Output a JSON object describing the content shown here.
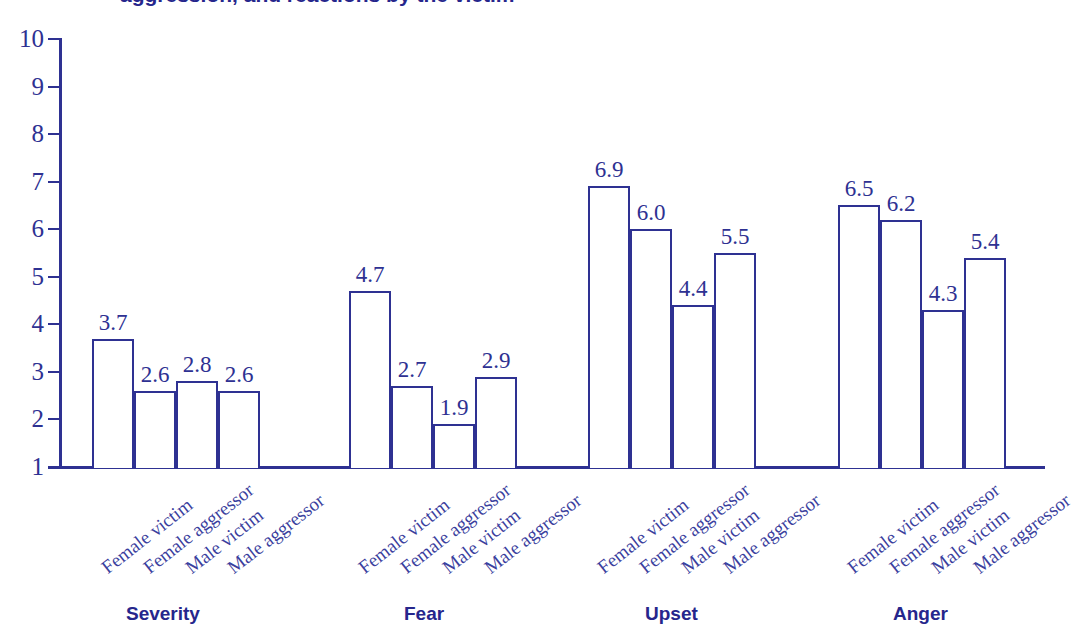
{
  "title": {
    "text": "aggression, and reactions by the victim"
  },
  "chart_data": {
    "type": "bar",
    "title": "aggression, and reactions by the victim",
    "xlabel": "",
    "ylabel": "",
    "ylim": [
      1,
      10
    ],
    "grid": false,
    "legend": "none",
    "y_ticks": [
      "1",
      "2",
      "3",
      "4",
      "5",
      "6",
      "7",
      "8",
      "9",
      "10"
    ],
    "categories": [
      "Female victim",
      "Female aggressor",
      "Male victim",
      "Male aggressor"
    ],
    "groups": [
      {
        "name": "Severity",
        "values": [
          3.7,
          2.6,
          2.8,
          2.6
        ],
        "labels": [
          "3.7",
          "2.6",
          "2.8",
          "2.6"
        ]
      },
      {
        "name": "Fear",
        "values": [
          4.7,
          2.7,
          1.9,
          2.9
        ],
        "labels": [
          "4.7",
          "2.7",
          "1.9",
          "2.9"
        ]
      },
      {
        "name": "Upset",
        "values": [
          6.9,
          6.0,
          4.4,
          5.5
        ],
        "labels": [
          "6.9",
          "6.0",
          "4.4",
          "5.5"
        ]
      },
      {
        "name": "Anger",
        "values": [
          6.5,
          6.2,
          4.3,
          5.4
        ],
        "labels": [
          "6.5",
          "6.2",
          "4.3",
          "5.4"
        ]
      }
    ],
    "colors": {
      "line": "#2e3192",
      "fill": "#ffffff",
      "text": "#2e3192",
      "group_label": "#26268c"
    }
  }
}
